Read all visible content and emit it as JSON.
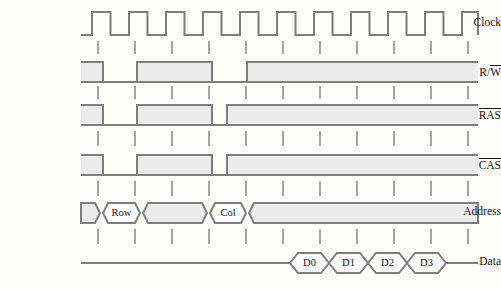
{
  "diagram": {
    "type": "timing-waveform",
    "colors": {
      "background": "#fdfdfb",
      "stroke": "#7d7d7d",
      "fill": "#ebebeb",
      "text": "#15120f",
      "tick": "#7d7d7d"
    },
    "geometry": {
      "wave_start_x": 81,
      "wave_end_x": 478,
      "clock_period": 37,
      "first_edge_x": 92,
      "label_right_x": 70
    },
    "signals": [
      {
        "name": "clock",
        "label": "Clock",
        "overline": "",
        "row_top": 12,
        "row_bottom": 35,
        "kind": "clock",
        "pulses": 11
      },
      {
        "name": "rw",
        "label": "R/W",
        "overline": "W",
        "label_prefix": "R/",
        "row_top": 62,
        "row_bottom": 82,
        "kind": "level",
        "segments": [
          {
            "x0": 81,
            "x1": 103,
            "state": "high"
          },
          {
            "x0": 103,
            "x1": 137,
            "state": "low"
          },
          {
            "x0": 137,
            "x1": 212,
            "state": "high"
          },
          {
            "x0": 212,
            "x1": 247,
            "state": "low"
          },
          {
            "x0": 247,
            "x1": 478,
            "state": "high"
          }
        ]
      },
      {
        "name": "ras",
        "label": "RAS",
        "overline": "RAS",
        "label_prefix": "",
        "row_top": 105,
        "row_bottom": 125,
        "kind": "level",
        "segments": [
          {
            "x0": 81,
            "x1": 103,
            "state": "high"
          },
          {
            "x0": 103,
            "x1": 137,
            "state": "low"
          },
          {
            "x0": 137,
            "x1": 212,
            "state": "high"
          },
          {
            "x0": 212,
            "x1": 227,
            "state": "low"
          },
          {
            "x0": 227,
            "x1": 478,
            "state": "high"
          }
        ]
      },
      {
        "name": "cas",
        "label": "CAS",
        "overline": "CAS",
        "label_prefix": "",
        "row_top": 155,
        "row_bottom": 175,
        "kind": "level",
        "segments": [
          {
            "x0": 81,
            "x1": 103,
            "state": "high"
          },
          {
            "x0": 103,
            "x1": 137,
            "state": "low"
          },
          {
            "x0": 137,
            "x1": 212,
            "state": "high"
          },
          {
            "x0": 212,
            "x1": 227,
            "state": "low"
          },
          {
            "x0": 227,
            "x1": 478,
            "state": "high"
          }
        ]
      },
      {
        "name": "address",
        "label": "Address",
        "overline": "",
        "row_top": 203,
        "row_bottom": 223,
        "kind": "bus",
        "cells": [
          {
            "x0": 81,
            "x1": 100,
            "text": ""
          },
          {
            "x0": 103,
            "x1": 140,
            "text": "Row"
          },
          {
            "x0": 143,
            "x1": 207,
            "text": ""
          },
          {
            "x0": 210,
            "x1": 246,
            "text": "Col"
          },
          {
            "x0": 249,
            "x1": 478,
            "text": ""
          }
        ]
      },
      {
        "name": "data",
        "label": "Data",
        "overline": "",
        "row_top": 253,
        "row_bottom": 273,
        "kind": "data",
        "idle_left": {
          "x0": 81,
          "x1": 290
        },
        "idle_right": {
          "x0": 446,
          "x1": 478
        },
        "cells": [
          {
            "x0": 290,
            "x1": 329,
            "text": "D0"
          },
          {
            "x0": 329,
            "x1": 368,
            "text": "D1"
          },
          {
            "x0": 368,
            "x1": 407,
            "text": "D2"
          },
          {
            "x0": 407,
            "x1": 446,
            "text": "D3"
          }
        ]
      }
    ],
    "tick_rows": [
      {
        "name": "ticks-after-clock",
        "y0": 41,
        "y1": 54
      },
      {
        "name": "ticks-after-rw",
        "y0": 86,
        "y1": 99
      },
      {
        "name": "ticks-after-ras",
        "y0": 131,
        "y1": 146
      },
      {
        "name": "ticks-after-cas",
        "y0": 181,
        "y1": 196
      },
      {
        "name": "ticks-after-address",
        "y0": 229,
        "y1": 244
      }
    ],
    "tick_xs": [
      98,
      135,
      172,
      209,
      246,
      283,
      320,
      357,
      394,
      431,
      468
    ]
  }
}
